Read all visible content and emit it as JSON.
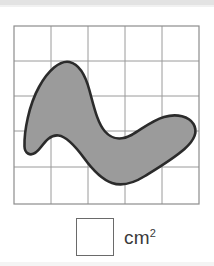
{
  "worksheet": {
    "task_type": "estimate-area-of-shape-on-grid",
    "answer_box": {
      "value": "",
      "placeholder": ""
    },
    "unit": {
      "text": "cm",
      "exponent": "2",
      "full": "cm2"
    }
  },
  "colors": {
    "page_background": "#ffffff",
    "grid_line": "#9a9a9a",
    "grid_border": "#8d8d8d",
    "shape_fill": "#9b9b9b",
    "shape_outline": "#2b2b2b",
    "answer_box_border": "#6a6a6a",
    "text": "#3a3a3a",
    "scan_edge": "#e3e3e3"
  },
  "grid": {
    "columns": 5,
    "rows": 5,
    "cell_size_px": 37,
    "x_left": 14,
    "y_top": 26,
    "x_right": 199,
    "y_bottom": 204,
    "vertical_line_x": [
      14,
      51,
      88,
      125,
      162,
      199
    ],
    "horizontal_line_y": [
      26,
      59.6,
      92.6,
      125.6,
      158.6,
      204
    ],
    "line_width_px": 1,
    "cell_area_label": "1 cm2"
  },
  "shape": {
    "name": "irregular-curved-blob",
    "description": "S-shaped closed curve spanning the grid, shaded grey with a dark outline",
    "outline_width_px": 2.6,
    "path": "M 24.5 146.5 C 24.0 131.0 29.0 105.0 39.0 87.0 C 48.0 70.5 60.0 60.0 69.5 62.0 C 79.5 64.2 85.5 75.5 89.5 90.5 C 94.0 107.0 97.5 123.0 105.0 131.5 C 112.5 140.0 122.5 140.0 131.5 135.0 C 142.0 129.0 152.0 120.5 164.0 117.0 C 177.0 113.2 189.0 116.5 193.5 124.0 C 198.0 131.5 194.0 140.5 184.5 149.0 C 173.0 159.0 158.0 168.0 145.0 176.0 C 133.0 183.5 122.0 186.5 112.0 183.0 C 101.0 179.2 92.0 169.0 84.0 158.0 C 75.5 146.5 67.0 136.5 58.5 135.5 C 50.5 134.6 45.5 141.0 41.0 147.0 C 36.5 153.0 31.5 155.5 28.0 153.5 C 25.6 152.1 24.6 149.8 24.5 146.5 Z",
    "landmarks": {
      "left_edge_x": 24,
      "top_peak": [
        69,
        62
      ],
      "upper_valley": [
        128,
        136
      ],
      "right_tip": [
        195,
        128
      ],
      "bottom_dip": [
        128,
        184
      ],
      "lower_left_bump": [
        47,
        137
      ]
    }
  }
}
